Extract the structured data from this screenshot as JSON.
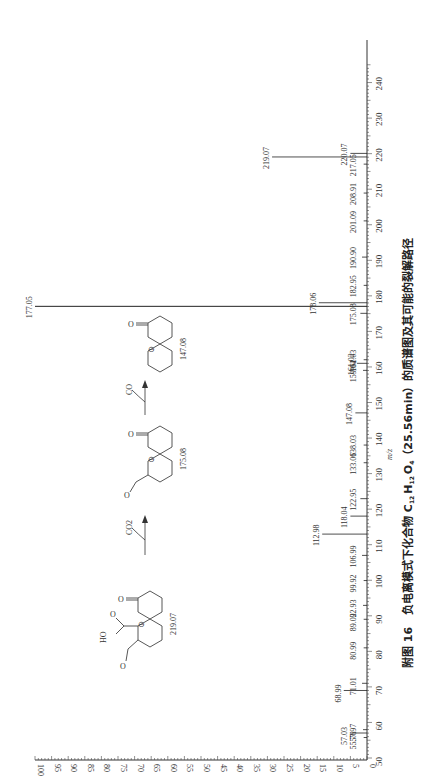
{
  "chart_data": {
    "type": "bar",
    "orientation": "rotated-90-ccw (m/z axis vertical on right, intensity increases leftward)",
    "title": "",
    "xlabel": "m/z",
    "ylabel": "相对丰度",
    "xlim": [
      50,
      245
    ],
    "ylim": [
      0,
      100
    ],
    "x_ticks": [
      50,
      60,
      70,
      80,
      90,
      100,
      110,
      120,
      130,
      140,
      150,
      160,
      170,
      180,
      190,
      200,
      210,
      220,
      230,
      240
    ],
    "y_ticks": [
      0,
      5,
      10,
      15,
      20,
      25,
      30,
      35,
      40,
      45,
      50,
      55,
      60,
      65,
      70,
      75,
      80,
      85,
      90,
      95,
      100
    ],
    "peaks": [
      {
        "mz": 55.76,
        "label": "55.76",
        "intensity": 1.0
      },
      {
        "mz": 57.03,
        "label": "57.03",
        "intensity": 5.0
      },
      {
        "mz": 57.97,
        "label": "57.97",
        "intensity": 1.2
      },
      {
        "mz": 68.99,
        "label": "68.99",
        "intensity": 7.0
      },
      {
        "mz": 71.01,
        "label": "71.01",
        "intensity": 1.5
      },
      {
        "mz": 80.99,
        "label": "80.99",
        "intensity": 1.0
      },
      {
        "mz": 89.02,
        "label": "89.02",
        "intensity": 1.0
      },
      {
        "mz": 92.93,
        "label": "92.93",
        "intensity": 1.2
      },
      {
        "mz": 99.92,
        "label": "99.92",
        "intensity": 1.0
      },
      {
        "mz": 106.99,
        "label": "106.99",
        "intensity": 1.5
      },
      {
        "mz": 112.98,
        "label": "112.98",
        "intensity": 13.5
      },
      {
        "mz": 118.04,
        "label": "118.04",
        "intensity": 5.0
      },
      {
        "mz": 122.95,
        "label": "122.95",
        "intensity": 2.0
      },
      {
        "mz": 133.06,
        "label": "133.06",
        "intensity": 1.0
      },
      {
        "mz": 138.03,
        "label": "138.03",
        "intensity": 1.0
      },
      {
        "mz": 147.08,
        "label": "147.08",
        "intensity": 3.5
      },
      {
        "mz": 159.04,
        "label": "159.04",
        "intensity": 1.2
      },
      {
        "mz": 161.02,
        "label": "161.02",
        "intensity": 3.0
      },
      {
        "mz": 162.03,
        "label": "162.03",
        "intensity": 1.0
      },
      {
        "mz": 175.08,
        "label": "175.08",
        "intensity": 2.0
      },
      {
        "mz": 177.05,
        "label": "177.05",
        "intensity": 100.0
      },
      {
        "mz": 178.06,
        "label": "178.06",
        "intensity": 14.5
      },
      {
        "mz": 182.95,
        "label": "182.95",
        "intensity": 1.0
      },
      {
        "mz": 190.9,
        "label": "190.90",
        "intensity": 1.5
      },
      {
        "mz": 201.09,
        "label": "201.09",
        "intensity": 1.0
      },
      {
        "mz": 208.91,
        "label": "208.91",
        "intensity": 1.0
      },
      {
        "mz": 217.05,
        "label": "217.05",
        "intensity": 1.0
      },
      {
        "mz": 219.07,
        "label": "219.07",
        "intensity": 28.6
      },
      {
        "mz": 220.07,
        "label": "220.07",
        "intensity": 5.0
      }
    ],
    "annotations": {
      "structures": [
        {
          "label": "219.07",
          "description": "precursor anion with COOH and CHO substituents"
        },
        {
          "label": "175.08",
          "description": "after loss of CO2"
        },
        {
          "label": "147.08",
          "description": "after loss of CO"
        }
      ],
      "neutral_losses": [
        "CO2",
        "CO"
      ]
    },
    "grid": false,
    "legend": null
  },
  "figure": {
    "caption_prefix": "附图 16",
    "caption_text": "负电离模式下化合物 C",
    "formula": {
      "C_sub": "12",
      "H": "H",
      "H_sub": "12",
      "O": "O",
      "O_sub": "4"
    },
    "caption_tail": "（25.56min）的质谱图及其可能的裂解路径",
    "x_axis_label": "m/z",
    "y_axis_label": "相对丰度"
  },
  "pathway": {
    "loss_1": "CO2",
    "loss_2": "CO",
    "struct_labels": [
      "219.07",
      "175.08",
      "147.08"
    ],
    "ho_label": "HO",
    "o_label": "O",
    "charge_symbol": "⊖"
  }
}
